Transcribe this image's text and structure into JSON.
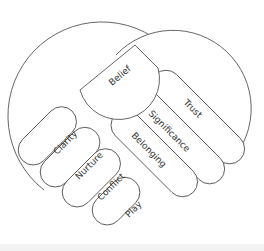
{
  "diagram": {
    "type": "handshake-heart",
    "stroke_color": "#555555",
    "fill_color": "#ffffff",
    "right_hand": {
      "thumb": "Belief",
      "fingers": [
        "Trust",
        "Significance",
        "Belonging"
      ]
    },
    "left_hand": {
      "fingers": [
        "Clarity",
        "Nurture",
        "Conflict",
        "Play"
      ]
    }
  }
}
